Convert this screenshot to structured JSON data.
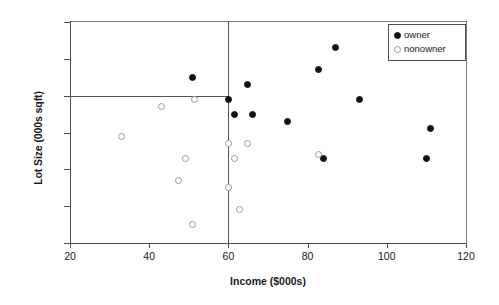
{
  "chart_data": {
    "type": "scatter",
    "title": "",
    "xlabel": "Income ($000s)",
    "ylabel": "Lot Size (000s sqft)",
    "xlim": [
      20,
      120
    ],
    "ylim": [
      13,
      25
    ],
    "xticks": [
      20,
      40,
      60,
      80,
      100,
      120
    ],
    "yticks": [
      13,
      15,
      17,
      19,
      21,
      23,
      25
    ],
    "grid": false,
    "legend_position": "top-right",
    "reference_lines": [
      {
        "axis": "x",
        "value": 60,
        "color": "#555555"
      },
      {
        "axis": "y",
        "value": 21,
        "color": "#555555",
        "x_end": 60
      }
    ],
    "series": [
      {
        "name": "owner",
        "marker": "filled-circle",
        "color": "#111111",
        "points": [
          {
            "x": 51.0,
            "y": 22.0
          },
          {
            "x": 60.0,
            "y": 20.8
          },
          {
            "x": 64.8,
            "y": 21.6
          },
          {
            "x": 61.5,
            "y": 20.0
          },
          {
            "x": 66.0,
            "y": 20.0
          },
          {
            "x": 75.0,
            "y": 19.6
          },
          {
            "x": 82.8,
            "y": 22.4
          },
          {
            "x": 87.0,
            "y": 23.6
          },
          {
            "x": 84.0,
            "y": 17.6
          },
          {
            "x": 93.0,
            "y": 20.8
          },
          {
            "x": 111.0,
            "y": 19.2
          },
          {
            "x": 110.1,
            "y": 17.6
          }
        ]
      },
      {
        "name": "nonowner",
        "marker": "open-circle",
        "color": "#9a9a9a",
        "points": [
          {
            "x": 33.0,
            "y": 18.8
          },
          {
            "x": 43.2,
            "y": 20.4
          },
          {
            "x": 51.4,
            "y": 20.8
          },
          {
            "x": 47.4,
            "y": 16.4
          },
          {
            "x": 49.2,
            "y": 17.6
          },
          {
            "x": 51.0,
            "y": 14.0
          },
          {
            "x": 60.0,
            "y": 18.4
          },
          {
            "x": 60.0,
            "y": 16.0
          },
          {
            "x": 62.8,
            "y": 14.8
          },
          {
            "x": 64.8,
            "y": 18.4
          },
          {
            "x": 61.5,
            "y": 17.6
          },
          {
            "x": 82.8,
            "y": 17.8
          }
        ]
      }
    ]
  },
  "legend": {
    "entries": [
      {
        "label": "owner",
        "marker": "filled-circle"
      },
      {
        "label": "nonowner",
        "marker": "open-circle"
      }
    ]
  }
}
